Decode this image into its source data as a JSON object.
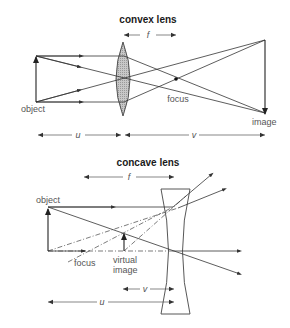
{
  "convex": {
    "title": "convex lens",
    "labels": {
      "object": "object",
      "focus": "focus",
      "image": "image",
      "f": "f",
      "u": "u",
      "v": "v"
    }
  },
  "concave": {
    "title": "concave lens",
    "labels": {
      "object": "object",
      "focus": "focus",
      "virtual_image_line1": "virtual",
      "virtual_image_line2": "image",
      "f": "f",
      "u": "u",
      "v": "v"
    }
  },
  "colors": {
    "ink": "#333333",
    "label": "#555555",
    "lens_fill": "#bdbdbd"
  }
}
